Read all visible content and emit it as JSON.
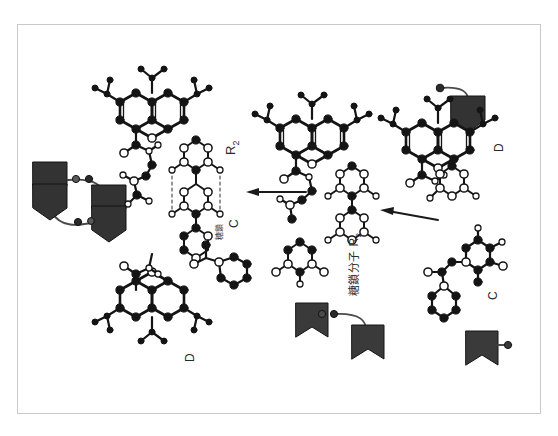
{
  "figure": {
    "domain_kind": "chemical-structure-diagram",
    "background_color": "#ffffff",
    "frame_color": "#c9c9c9",
    "ink_color": "#1a1a1a",
    "glyph_fill_dark": "#3a3a3a",
    "glyph_fill_darker": "#262626",
    "orientation_note": "page rotated 90 degrees; all text reads bottom-to-top"
  },
  "labels": [
    {
      "id": "label-r2-left",
      "text": "R",
      "sub": "2",
      "name": "r2-label-left"
    },
    {
      "id": "label-r2-right",
      "text": "R",
      "sub": "2",
      "name": "r2-label-right"
    },
    {
      "id": "label-c-left",
      "text": "C",
      "sub": "",
      "name": "c-label-left"
    },
    {
      "id": "label-c-right",
      "text": "C",
      "sub": "",
      "name": "c-label-right"
    },
    {
      "id": "label-d-left",
      "text": "D",
      "sub": "",
      "name": "d-label-left"
    },
    {
      "id": "label-d-right",
      "text": "D",
      "sub": "",
      "name": "d-label-right"
    }
  ],
  "annotations": {
    "center_caption": "糖鎖",
    "right_caption": "糖鎖分子",
    "right_caption_sub": "R2"
  },
  "arrows": [
    {
      "name": "reaction-arrow-upper",
      "direction": "left"
    },
    {
      "name": "reaction-arrow-lower",
      "direction": "left"
    }
  ],
  "glyph_groups": [
    {
      "name": "shield-pair-top-left",
      "count": 2,
      "linker_dots": 4
    },
    {
      "name": "shield-single-top-right",
      "count": 1,
      "linker_dots": 1
    },
    {
      "name": "banner-pair-bottom-center",
      "count": 2,
      "linker_dots": 2
    },
    {
      "name": "banner-single-bottom-right",
      "count": 1,
      "linker_dots": 1
    }
  ],
  "molecules": [
    {
      "name": "xanthene-core-left",
      "rings": 3,
      "position": "upper-left"
    },
    {
      "name": "xanthene-core-right",
      "rings": 3,
      "position": "upper-right"
    },
    {
      "name": "sugar-chain-left",
      "position": "center-left"
    },
    {
      "name": "sugar-chain-right",
      "position": "center-right"
    },
    {
      "name": "phenyl-ester-left",
      "position": "lower-center"
    },
    {
      "name": "phenyl-ester-right",
      "position": "lower-right"
    },
    {
      "name": "xanthene-core-bottom",
      "rings": 3,
      "position": "bottom-left"
    }
  ]
}
